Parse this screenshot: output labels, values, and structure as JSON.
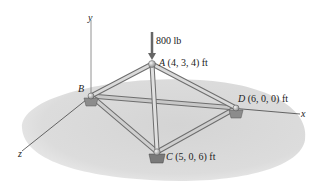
{
  "diagram": {
    "type": "3D space truss",
    "load": {
      "value": "800 lb",
      "direction": "downward",
      "applied_at": "A"
    },
    "axes": {
      "x": "x",
      "y": "y",
      "z": "z"
    },
    "joints": {
      "A": {
        "name": "A",
        "coords": "(4, 3, 4) ft"
      },
      "B": {
        "name": "B",
        "coords": ""
      },
      "C": {
        "name": "C",
        "coords": "(5, 0, 6) ft"
      },
      "D": {
        "name": "D",
        "coords": "(6, 0, 0) ft"
      }
    },
    "members": [
      "AB",
      "AC",
      "AD",
      "BC",
      "BD",
      "CD"
    ],
    "colors": {
      "ground": "#d9d9d9",
      "member": "#b8b8b8",
      "member_edge": "#6e6e6e",
      "axis": "#555555",
      "text": "#222222"
    }
  }
}
